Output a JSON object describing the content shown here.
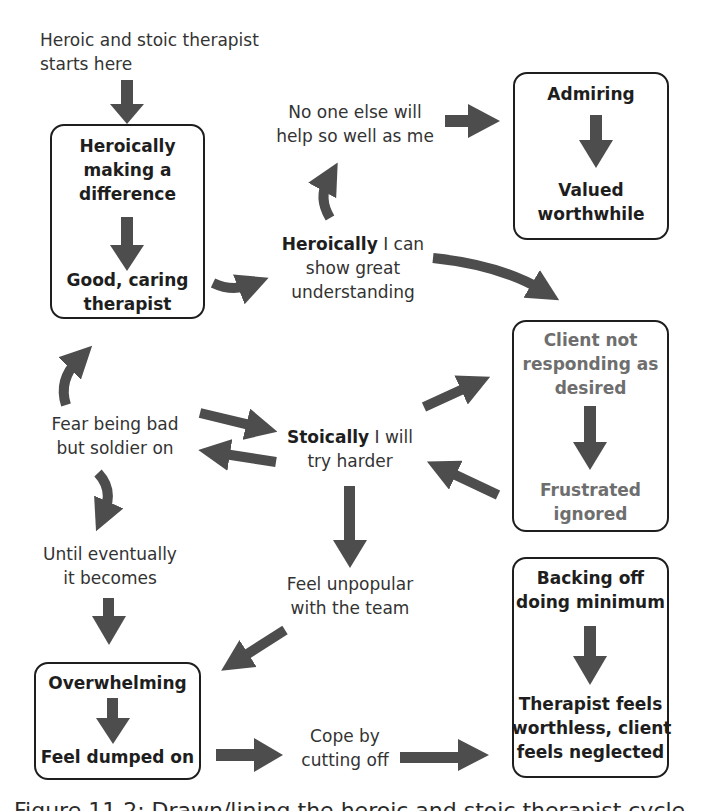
{
  "diagram": {
    "start_label": [
      "Heroic and stoic therapist",
      "starts here"
    ],
    "boxes": {
      "heroic": {
        "top": [
          "Heroically",
          "making a",
          "difference"
        ],
        "bottom": [
          "Good, caring",
          "therapist"
        ]
      },
      "admiring": {
        "top": [
          "Admiring"
        ],
        "bottom": [
          "Valued",
          "worthwhile"
        ]
      },
      "client": {
        "top": [
          "Client not",
          "responding as",
          "desired"
        ],
        "bottom": [
          "Frustrated",
          "ignored"
        ]
      },
      "overwhelming": {
        "top": [
          "Overwhelming"
        ],
        "bottom": [
          "Feel dumped on"
        ]
      },
      "backing_off": {
        "top": [
          "Backing off",
          "doing minimum"
        ],
        "bottom": [
          "Therapist feels",
          "worthless, client",
          "feels neglected"
        ]
      }
    },
    "nodes": {
      "no_one_else": [
        "No one else will",
        "help so well as me"
      ],
      "heroically_i_can": {
        "bold": "Heroically",
        "rest": " I can",
        "line2": "show great",
        "line3": "understanding"
      },
      "fear_being_bad": [
        "Fear being bad",
        "but soldier on"
      ],
      "stoically": {
        "bold": "Stoically",
        "rest": " I will",
        "line2": "try harder"
      },
      "until_eventually": [
        "Until eventually",
        "it becomes"
      ],
      "feel_unpopular": [
        "Feel unpopular",
        "with the team"
      ],
      "cope_by": [
        "Cope by",
        "cutting off"
      ]
    },
    "caption": "Figure 11.2: Drawn/lining the heroic and stoic therapist cycle",
    "colors": {
      "arrow": "#4d4d4d",
      "border": "#1e1e1e",
      "muted_text": "#7a7a7a"
    }
  }
}
